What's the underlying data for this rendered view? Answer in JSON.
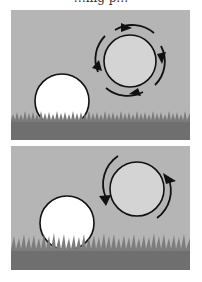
{
  "caption": "…ing p…",
  "colors": {
    "sky": "#b5b5b5",
    "grass_dark": "#6f6f6f",
    "grass_light": "#8a8a8a",
    "ball_white": "#ffffff",
    "sphere_fill": "#d4d4d4",
    "stroke": "#111111"
  },
  "panels": [
    {
      "id": "top",
      "label": "ball-and-rotating-sphere-4-arrows",
      "arrows": 4
    },
    {
      "id": "bottom",
      "label": "ball-and-rotating-sphere-2-arrows",
      "arrows": 2
    }
  ]
}
